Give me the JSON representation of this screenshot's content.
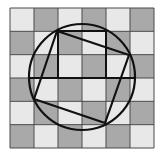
{
  "figure": {
    "grid": {
      "rows": 6,
      "cols": 6,
      "x0": 10,
      "y0": 8,
      "x1": 154,
      "y1": 148,
      "light_color": "#e8e8e8",
      "dark_color": "#a9a9a9",
      "line_color": "#4a4a4a",
      "pattern": "checkerboard, top-left light"
    },
    "circle": {
      "cx": 82,
      "cy": 77,
      "r": 53,
      "stroke": "#111111"
    },
    "quadrilateral": {
      "vertices": [
        [
          57,
          31
        ],
        [
          129,
          55
        ],
        [
          105,
          123
        ],
        [
          34,
          99
        ]
      ],
      "stroke": "#111111"
    },
    "construction_lines": [
      {
        "x1": 58,
        "y1": 31,
        "x2": 58,
        "y2": 78
      },
      {
        "x1": 58,
        "y1": 31,
        "x2": 106,
        "y2": 31
      },
      {
        "x1": 106,
        "y1": 31,
        "x2": 106,
        "y2": 78
      },
      {
        "x1": 28,
        "y1": 78,
        "x2": 136,
        "y2": 78
      }
    ]
  }
}
